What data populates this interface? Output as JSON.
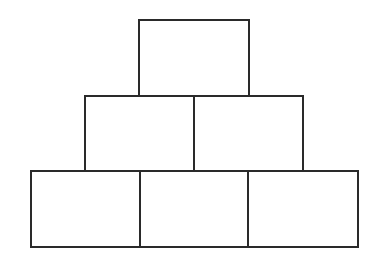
{
  "diagram": {
    "type": "block-pyramid",
    "background": "#ffffff",
    "stroke_color": "#2a2a2a",
    "rows": [
      {
        "name": "top",
        "boxes": [
          {
            "x": 139,
            "y": 20,
            "w": 110,
            "h": 76
          }
        ]
      },
      {
        "name": "middle",
        "boxes": [
          {
            "x": 85,
            "y": 96,
            "w": 109,
            "h": 75
          },
          {
            "x": 194,
            "y": 96,
            "w": 109,
            "h": 75
          }
        ]
      },
      {
        "name": "bottom",
        "boxes": [
          {
            "x": 31,
            "y": 171,
            "w": 109,
            "h": 76
          },
          {
            "x": 140,
            "y": 171,
            "w": 108,
            "h": 76
          },
          {
            "x": 248,
            "y": 171,
            "w": 110,
            "h": 76
          }
        ]
      }
    ]
  }
}
